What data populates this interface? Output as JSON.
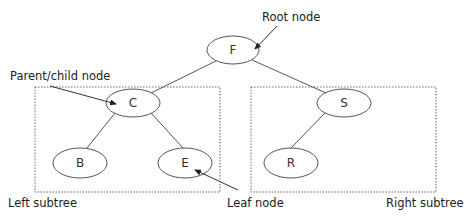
{
  "diagram": {
    "type": "binary-tree",
    "nodes": [
      {
        "id": "F",
        "label": "F",
        "role": "root",
        "cx": 233,
        "cy": 50
      },
      {
        "id": "C",
        "label": "C",
        "role": "parent/child",
        "cx": 133,
        "cy": 103
      },
      {
        "id": "S",
        "label": "S",
        "role": "parent/child",
        "cx": 344,
        "cy": 103
      },
      {
        "id": "B",
        "label": "B",
        "role": "leaf",
        "cx": 80,
        "cy": 163
      },
      {
        "id": "E",
        "label": "E",
        "role": "leaf",
        "cx": 185,
        "cy": 163
      },
      {
        "id": "R",
        "label": "R",
        "role": "leaf",
        "cx": 291,
        "cy": 163
      }
    ],
    "edges": [
      {
        "from": "F",
        "to": "C"
      },
      {
        "from": "F",
        "to": "S"
      },
      {
        "from": "C",
        "to": "B"
      },
      {
        "from": "C",
        "to": "E"
      },
      {
        "from": "S",
        "to": "R"
      }
    ],
    "annotations": {
      "root_node": "Root node",
      "parent_child_node": "Parent/child node",
      "leaf_node": "Leaf node",
      "left_subtree": "Left subtree",
      "right_subtree": "Right subtree"
    },
    "subtrees": [
      {
        "name": "left",
        "label": "Left subtree",
        "contains": [
          "C",
          "B",
          "E"
        ]
      },
      {
        "name": "right",
        "label": "Right subtree",
        "contains": [
          "S",
          "R"
        ]
      }
    ],
    "colors": {
      "stroke": "#555555",
      "text": "#222222",
      "background": "#ffffff"
    }
  }
}
